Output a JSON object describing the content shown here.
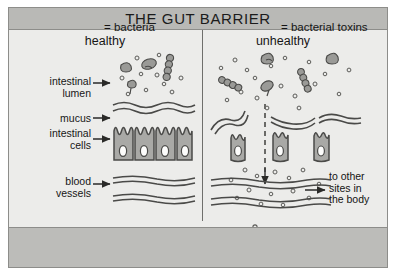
{
  "figure": {
    "title": "THE GUT BARRIER",
    "panels": {
      "healthy_header": "healthy",
      "unhealthy_header": "unhealthy"
    },
    "row_labels": [
      {
        "name": "intestinal-lumen",
        "line1": "intestinal",
        "line2": "lumen"
      },
      {
        "name": "mucus",
        "line1": "mucus",
        "line2": ""
      },
      {
        "name": "intestinal-cells",
        "line1": "intestinal",
        "line2": "cells"
      },
      {
        "name": "blood-vessels",
        "line1": "blood",
        "line2": "vessels"
      }
    ],
    "annotation": {
      "line1": "to other",
      "line2": "sites in",
      "line3": "the body"
    },
    "legend": [
      {
        "name": "bacteria",
        "label": "= bacteria"
      },
      {
        "name": "bacterial-toxins",
        "label": "= bacterial toxins"
      }
    ],
    "colors": {
      "background": "#ececea",
      "title_band": "#b9b9b6",
      "legend_band": "#bcbcb9",
      "ink": "#4a4a48",
      "cell_fill": "#a9a9a6",
      "frame": "#8d8d8a"
    }
  }
}
